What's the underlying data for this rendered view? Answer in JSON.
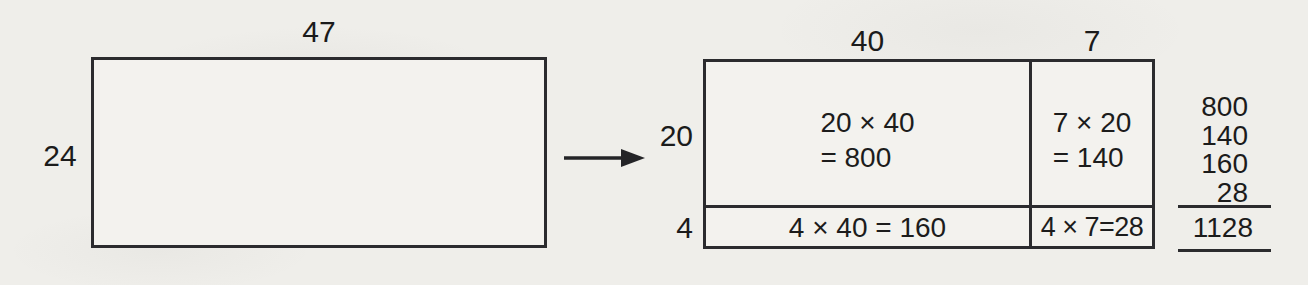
{
  "left_rect": {
    "top_label": "47",
    "side_label": "24"
  },
  "right_rect": {
    "col_labels": [
      "40",
      "7"
    ],
    "row_labels": [
      "20",
      "4"
    ],
    "cells": {
      "top_left": {
        "line1": "20 × 40",
        "line2": "= 800"
      },
      "top_right": {
        "line1": "7 × 20",
        "line2": "= 140"
      },
      "bottom_left": "4 × 40 = 160",
      "bottom_right": "4 × 7=28"
    }
  },
  "sum_column": {
    "addends": [
      "800",
      "140",
      "160",
      "28"
    ],
    "total": "1128"
  },
  "colors": {
    "paper": "#efeeea",
    "ink": "#1c1c1c",
    "line": "#2b2b2e"
  }
}
